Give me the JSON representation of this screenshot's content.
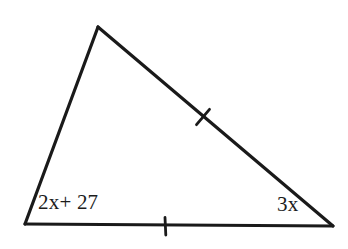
{
  "figure": {
    "kind": "geometry-diagram",
    "shape": "triangle",
    "background_color": "#ffffff",
    "stroke_color": "#1a1a1a",
    "stroke_width": 3,
    "canvas": {
      "width": 348,
      "height": 249
    },
    "vertices": {
      "apex": {
        "x": 98,
        "y": 27
      },
      "bottom_left": {
        "x": 25,
        "y": 224
      },
      "bottom_right": {
        "x": 333,
        "y": 226
      }
    },
    "sides": [
      {
        "name": "left-side",
        "from": "bottom_left",
        "to": "apex",
        "ticks": 0
      },
      {
        "name": "hypotenuse",
        "from": "apex",
        "to": "bottom_right",
        "ticks": 1
      },
      {
        "name": "base",
        "from": "bottom_left",
        "to": "bottom_right",
        "ticks": 1
      }
    ],
    "tick_marks": [
      {
        "name": "hypotenuse-tick",
        "x": 203,
        "y": 117,
        "length": 17,
        "orientation": "perpendicular-to-hypotenuse"
      },
      {
        "name": "base-tick",
        "x": 165,
        "y": 226,
        "length": 17,
        "orientation": "vertical"
      }
    ],
    "labels": {
      "left_angle": "2x+ 27",
      "right_angle": "3x"
    }
  }
}
